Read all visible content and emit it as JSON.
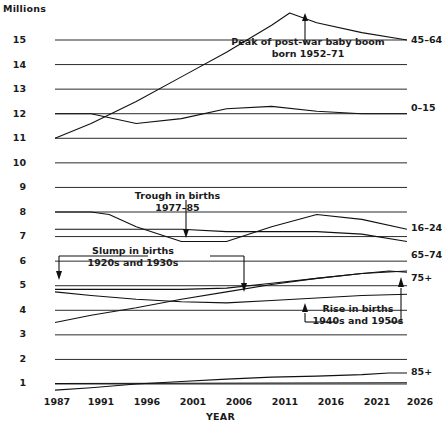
{
  "chart_data": {
    "type": "line",
    "title": "",
    "unit_label": "Millions",
    "xlabel": "YEAR",
    "ylabel": "Millions",
    "grid": true,
    "legend_position": "right-of-line-ends",
    "xlim": [
      1987,
      2026
    ],
    "ylim": [
      0,
      15.6
    ],
    "x_ticks": [
      "1987",
      "1991",
      "1996",
      "2001",
      "2006",
      "2011",
      "2016",
      "2021",
      "2026"
    ],
    "x_tick_values": [
      1987,
      1991,
      1996,
      2001,
      2006,
      2011,
      2016,
      2021,
      2026
    ],
    "y_ticks": [
      "1",
      "2",
      "3",
      "4",
      "5",
      "6",
      "7",
      "8",
      "9",
      "10",
      "11",
      "12",
      "13",
      "14",
      "15"
    ],
    "y_tick_values": [
      1,
      2,
      3,
      4,
      5,
      6,
      7,
      8,
      9,
      10,
      11,
      12,
      13,
      14,
      15
    ],
    "series": [
      {
        "name": "45-64",
        "label": "45–64",
        "x": [
          1987,
          1991,
          1996,
          2001,
          2006,
          2011,
          2013,
          2016,
          2021,
          2026
        ],
        "values": [
          11.0,
          11.6,
          12.5,
          13.5,
          14.5,
          15.6,
          16.1,
          15.7,
          15.3,
          15.0
        ]
      },
      {
        "name": "0-15",
        "label": "0–15",
        "x": [
          1987,
          1991,
          1996,
          2001,
          2006,
          2011,
          2016,
          2021,
          2026
        ],
        "values": [
          12.0,
          12.0,
          11.6,
          11.8,
          12.2,
          12.3,
          12.1,
          12.0,
          12.0
        ]
      },
      {
        "name": "16-24",
        "label": "16–24",
        "x": [
          1987,
          1991,
          1993,
          1996,
          2001,
          2006,
          2011,
          2016,
          2021,
          2026
        ],
        "values": [
          8.0,
          8.0,
          7.9,
          7.4,
          6.8,
          6.8,
          7.4,
          7.9,
          7.7,
          7.3
        ]
      },
      {
        "name": "65-74",
        "label": "65–74",
        "x": [
          1987,
          1991,
          1996,
          2001,
          2006,
          2011,
          2016,
          2021,
          2026
        ],
        "values": [
          7.3,
          7.3,
          7.3,
          7.3,
          7.2,
          7.2,
          7.2,
          7.1,
          6.8
        ]
      },
      {
        "name": "75+",
        "label": "75+",
        "x": [
          1987,
          1991,
          1996,
          2001,
          2006,
          2011,
          2016,
          2021,
          2024,
          2026
        ],
        "values": [
          4.85,
          4.85,
          4.85,
          4.85,
          4.9,
          5.1,
          5.3,
          5.5,
          5.6,
          5.55
        ]
      },
      {
        "name": "75-plus-lower",
        "label": "",
        "x": [
          1987,
          1991,
          1996,
          2001,
          2006,
          2011,
          2016,
          2021,
          2026
        ],
        "values": [
          4.75,
          4.6,
          4.45,
          4.35,
          4.3,
          4.4,
          4.5,
          4.6,
          4.65
        ]
      },
      {
        "name": "unlabelled-rising-mid",
        "label": "",
        "x": [
          1987,
          1991,
          1996,
          2001,
          2006,
          2011,
          2016,
          2021,
          2026
        ],
        "values": [
          3.5,
          3.8,
          4.1,
          4.45,
          4.75,
          5.05,
          5.3,
          5.5,
          5.6
        ]
      },
      {
        "name": "85+",
        "label": "85+",
        "x": [
          1987,
          1991,
          1996,
          2001,
          2006,
          2011,
          2016,
          2021,
          2024,
          2026
        ],
        "values": [
          0.75,
          0.85,
          1.0,
          1.1,
          1.2,
          1.28,
          1.32,
          1.38,
          1.45,
          1.45
        ]
      },
      {
        "name": "flat-one-million",
        "label": "",
        "x": [
          1987,
          2026
        ],
        "values": [
          1.02,
          1.05
        ]
      }
    ],
    "annotations": [
      {
        "name": "peak-post-war-baby-boom",
        "lines": [
          "Peak of post-war baby boom",
          "born 1952–71"
        ],
        "target_year": 2014,
        "target_value": 16.1
      },
      {
        "name": "trough-in-births",
        "lines": [
          "Trough in births",
          "1977–85"
        ],
        "target_year": 2000,
        "target_value": 6.8
      },
      {
        "name": "slump-in-births",
        "lines": [
          "Slump in births",
          "1920s and 1930s"
        ],
        "target_years": [
          1987,
          2004
        ],
        "target_values": [
          4.9,
          4.85
        ]
      },
      {
        "name": "rise-in-births",
        "lines": [
          "Rise in births",
          "1940s and 1950s"
        ],
        "target_years": [
          2006,
          2023
        ],
        "target_values": [
          4.3,
          5.55
        ]
      }
    ]
  },
  "axis": {
    "unit_label": "Millions",
    "x_title": "YEAR"
  },
  "ticks": {
    "y": [
      "15",
      "14",
      "13",
      "12",
      "11",
      "10",
      "9",
      "8",
      "7",
      "6",
      "5",
      "4",
      "3",
      "2",
      "1"
    ],
    "x": [
      "1987",
      "1991",
      "1996",
      "2001",
      "2006",
      "2011",
      "2016",
      "2021",
      "2026"
    ]
  },
  "series_labels": {
    "s0": "45–64",
    "s1": "0–15",
    "s2": "16–24",
    "s3": "65–74",
    "s4": "75+",
    "s5": "85+"
  },
  "annotations": {
    "peak": {
      "l1": "Peak of post-war baby boom",
      "l2": "born 1952–71"
    },
    "trough": {
      "l1": "Trough in births",
      "l2": "1977–85"
    },
    "slump": {
      "l1": "Slump in births",
      "l2": "1920s and 1930s"
    },
    "rise": {
      "l1": "Rise in births",
      "l2": "1940s and 1950s"
    }
  },
  "colors": {
    "line": "#111111",
    "grid": "#2b2b2b",
    "background": "#ffffff",
    "text": "#1a1a1a"
  }
}
